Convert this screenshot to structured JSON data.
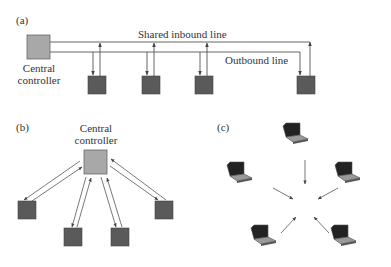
{
  "panels": {
    "a": {
      "label": "(a)",
      "controller_label_line1": "Central",
      "controller_label_line2": "controller",
      "inbound_line_label": "Shared inbound line",
      "outbound_line_label": "Outbound line",
      "station_count": 4
    },
    "b": {
      "label": "(b)",
      "controller_label_line1": "Central",
      "controller_label_line2": "controller",
      "station_count": 4
    },
    "c": {
      "label": "(c)",
      "laptop_count": 5
    }
  },
  "colors": {
    "controller_fill": "#a8a8a8",
    "station_fill": "#5a5a5a",
    "line": "#555555",
    "text": "#333333"
  }
}
